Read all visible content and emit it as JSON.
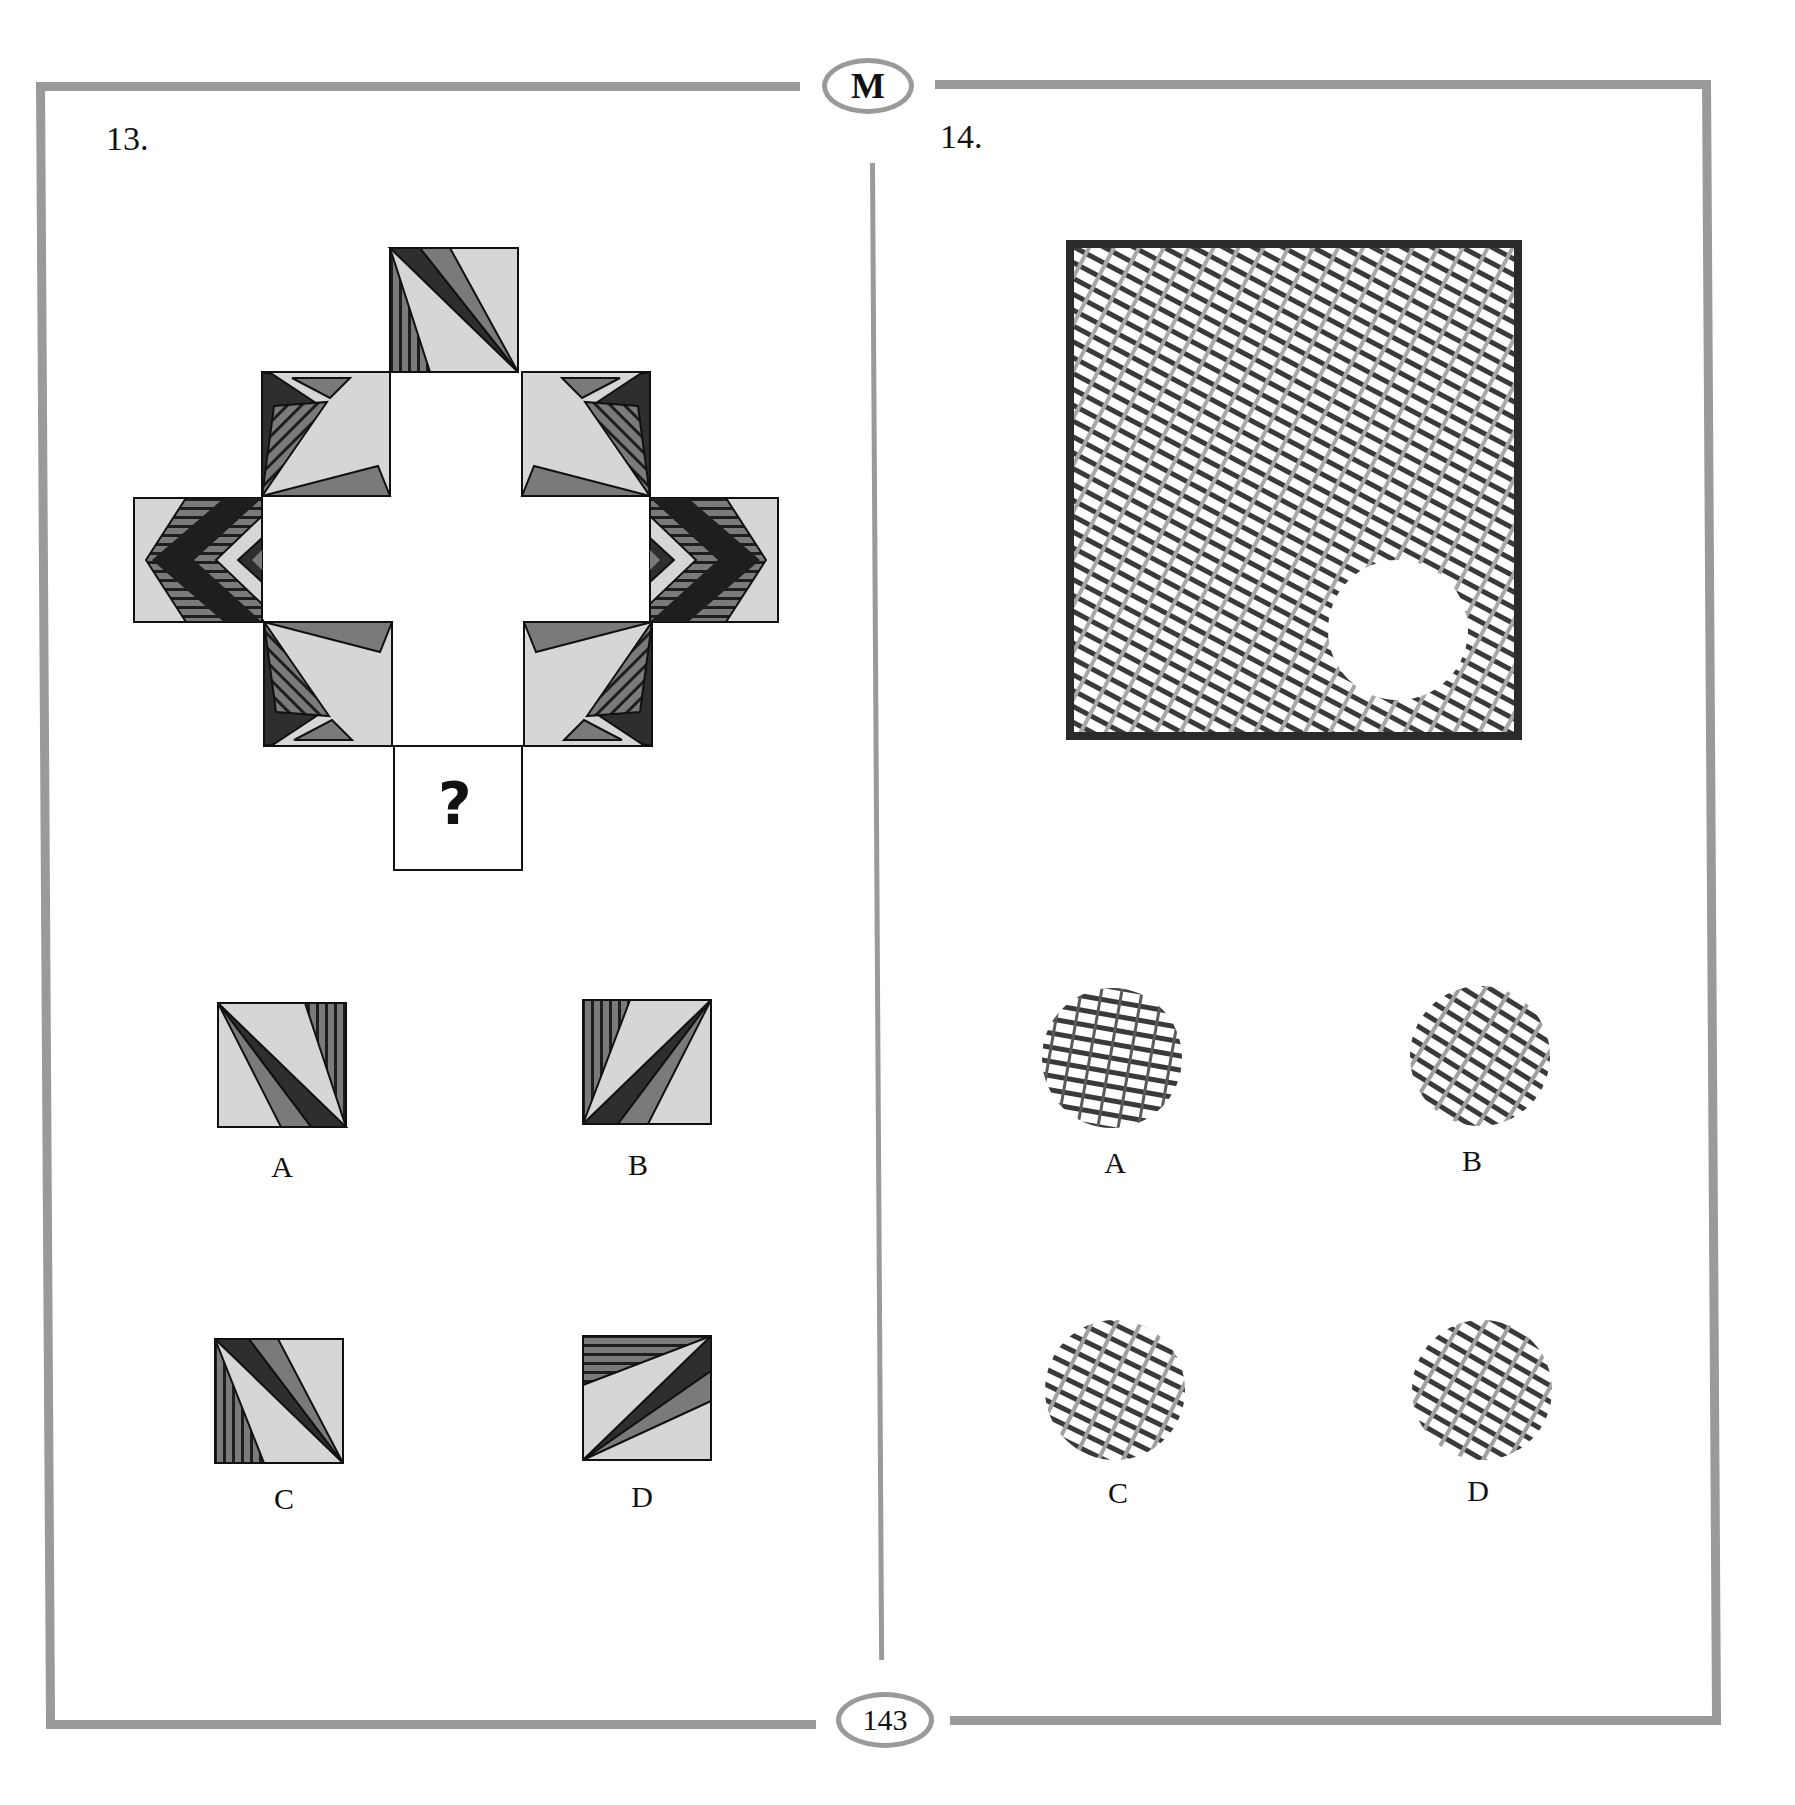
{
  "header": {
    "badge": "M"
  },
  "footer": {
    "page_number": "143"
  },
  "colors": {
    "frame": "#9a9a9a",
    "tile_light": "#d6d6d6",
    "tile_mid": "#7a7a7a",
    "tile_dark": "#2e2e2e",
    "line": "#111111"
  },
  "question13": {
    "number": "13.",
    "missing_tile_symbol": "?",
    "options": [
      {
        "label": "A"
      },
      {
        "label": "B"
      },
      {
        "label": "C"
      },
      {
        "label": "D"
      }
    ]
  },
  "question14": {
    "number": "14.",
    "options": [
      {
        "label": "A"
      },
      {
        "label": "B"
      },
      {
        "label": "C"
      },
      {
        "label": "D"
      }
    ]
  }
}
